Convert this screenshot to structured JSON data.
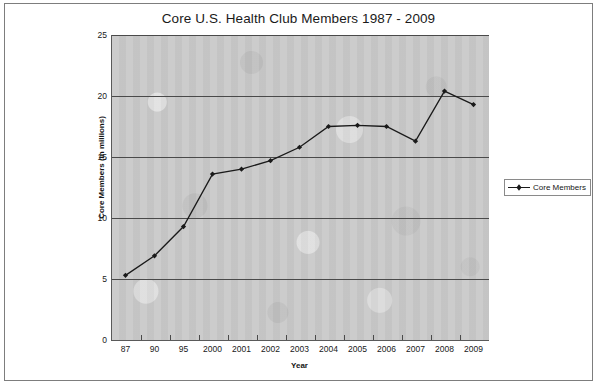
{
  "chart_data": {
    "type": "line",
    "title": "Core U.S. Health Club Members 1987 - 2009",
    "xlabel": "Year",
    "ylabel": "Core Members (in millions)",
    "categories": [
      "87",
      "90",
      "95",
      "2000",
      "2001",
      "2002",
      "2003",
      "2004",
      "2005",
      "2006",
      "2007",
      "2008",
      "2009"
    ],
    "values": [
      5.3,
      6.9,
      9.3,
      13.6,
      14.0,
      14.7,
      15.8,
      17.5,
      17.6,
      17.5,
      16.3,
      20.4,
      19.3
    ],
    "series": [
      {
        "name": "Core Members",
        "values": [
          5.3,
          6.9,
          9.3,
          13.6,
          14.0,
          14.7,
          15.8,
          17.5,
          17.6,
          17.5,
          16.3,
          20.4,
          19.3
        ]
      }
    ],
    "ylim": [
      0,
      25
    ],
    "yticks": [
      0,
      5,
      10,
      15,
      20,
      25
    ],
    "ytick_labels": [
      "0",
      "5",
      "10",
      "15",
      "20",
      "25"
    ],
    "grid": "horizontal",
    "legend_position": "right",
    "legend_entries": [
      "Core Members"
    ],
    "marker": "filled-diamond",
    "line_color": "#1a1a1a",
    "plot_background": "#c9c9c9",
    "figure_background": "#ffffff"
  }
}
